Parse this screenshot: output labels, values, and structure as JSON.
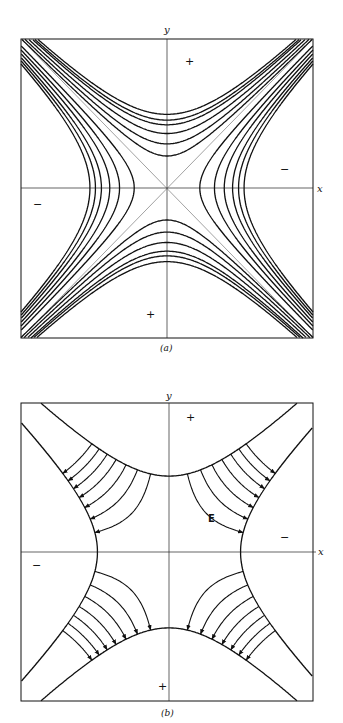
{
  "figure": {
    "panels": [
      {
        "id": "a",
        "caption": "(a)",
        "axis_labels": {
          "x": "x",
          "y": "y"
        },
        "description": "Equipotential hyperbolas x^2 - y^2 = const with asymptotes y = ±x",
        "signs": {
          "top": "+",
          "bottom": "+",
          "right": "−",
          "left": "−"
        },
        "contour_levels_vertical": [
          -1,
          -1.9,
          -2.9,
          -3.9,
          -4.5,
          -5.3
        ],
        "contour_levels_horizontal": [
          1.05,
          2.2,
          3.2,
          4.2,
          5.0,
          5.8
        ]
      },
      {
        "id": "b",
        "caption": "(b)",
        "axis_labels": {
          "x": "x",
          "y": "y"
        },
        "field_label": "E",
        "description": "Hyperbolic electrodes with field lines xy = const directed from + to − electrodes",
        "signs": {
          "top": "+",
          "bottom": "+",
          "right": "−",
          "left": "−"
        },
        "field_lines_per_quadrant": 7
      }
    ]
  }
}
